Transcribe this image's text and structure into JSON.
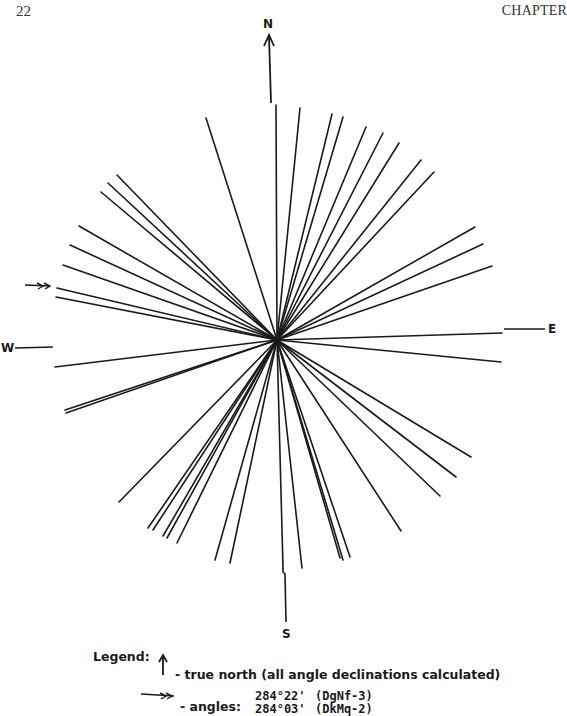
{
  "page": {
    "number": "22",
    "running_header": "CHAPTER"
  },
  "compass": {
    "north": "N",
    "south": "S",
    "east": "E",
    "west": "W",
    "center": [
      277,
      340
    ]
  },
  "legend": {
    "title": "Legend:",
    "north_desc": "- true north (all angle declinations calculated)",
    "angles_label": "- angles:",
    "angles": [
      {
        "value": "284°22'",
        "site": "(DgNf-3)"
      },
      {
        "value": "284°03'",
        "site": "(DkMq-2)"
      }
    ]
  },
  "rays": [
    [
      206,
      118
    ],
    [
      276,
      105
    ],
    [
      300,
      108
    ],
    [
      332,
      114
    ],
    [
      343,
      117
    ],
    [
      366,
      127
    ],
    [
      383,
      133
    ],
    [
      399,
      143
    ],
    [
      421,
      160
    ],
    [
      434,
      172
    ],
    [
      475,
      227
    ],
    [
      483,
      244
    ],
    [
      492,
      266
    ],
    [
      502,
      333
    ],
    [
      501,
      362
    ],
    [
      471,
      457
    ],
    [
      456,
      477
    ],
    [
      440,
      496
    ],
    [
      401,
      531
    ],
    [
      350,
      557
    ],
    [
      343,
      560
    ],
    [
      340,
      558
    ],
    [
      302,
      568
    ],
    [
      283,
      568
    ],
    [
      230,
      563
    ],
    [
      215,
      560
    ],
    [
      177,
      543
    ],
    [
      167,
      538
    ],
    [
      163,
      536
    ],
    [
      153,
      530
    ],
    [
      148,
      528
    ],
    [
      119,
      502
    ],
    [
      66,
      413
    ],
    [
      65,
      410
    ],
    [
      55,
      367
    ],
    [
      56,
      297
    ],
    [
      57,
      288
    ],
    [
      63,
      265
    ],
    [
      70,
      245
    ],
    [
      79,
      226
    ],
    [
      101,
      192
    ],
    [
      108,
      183
    ],
    [
      117,
      175
    ]
  ],
  "marker_arrow_target": [
    56,
    288
  ]
}
